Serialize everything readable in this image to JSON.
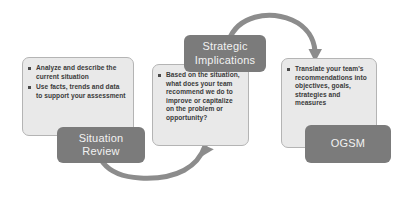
{
  "diagram": {
    "background_color": "#ffffff",
    "box_fill_color": "#e9e9e9",
    "box_border_color": "#b4b4b4",
    "label_fill_color": "#7b7b7b",
    "label_text_color": "#f2f2f2",
    "arrow_color": "#8c8c8c"
  },
  "stages": [
    {
      "id": "situation-review",
      "label": "Situation Review",
      "label_line_1": "Situation",
      "label_line_2": "Review",
      "bullets": [
        "Analyze and describe the current situation",
        "Use facts, trends and data to support your assessment"
      ]
    },
    {
      "id": "strategic-implications",
      "label": "Strategic Implications",
      "label_line_1": "Strategic",
      "label_line_2": "Implications",
      "bullets": [
        "Based on the situation, what does your team recommend we do to improve or capitalize on the problem or opportunity?"
      ]
    },
    {
      "id": "ogsm",
      "label": "OGSM",
      "label_line_1": "OGSM",
      "label_line_2": "",
      "bullets": [
        "Translate your team's recommendations into objectives, goals, strategies and measures"
      ]
    }
  ],
  "connectors": [
    {
      "id": "arrow-situation-to-strategic",
      "from": "situation-review",
      "to": "strategic-implications",
      "shape": "u-curve-below",
      "direction": "up-right"
    },
    {
      "id": "arrow-strategic-to-ogsm",
      "from": "strategic-implications",
      "to": "ogsm",
      "shape": "arc-above",
      "direction": "down-right"
    }
  ]
}
